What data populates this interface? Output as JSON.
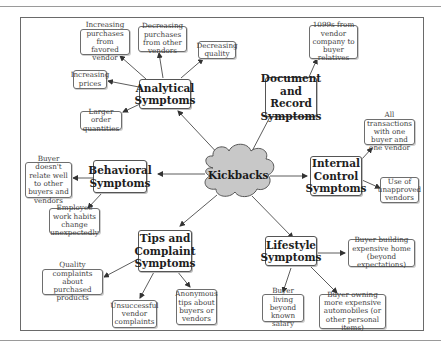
{
  "diagram": {
    "center": {
      "label": "Kickbacks",
      "shape": "cloud",
      "fill": "#c8c8c8"
    },
    "categories": [
      {
        "label": "Analytical Symptoms",
        "leaves": [
          "Increasing purchases from favored vendor",
          "Decreasing purchases from other vendors",
          "Decreasing quality",
          "Increasing prices",
          "Larger order quantities"
        ]
      },
      {
        "label": "Document and Record Symptoms",
        "leaves": [
          "1099s from vendor company to buyer relatives"
        ]
      },
      {
        "label": "Internal Control Symptoms",
        "leaves": [
          "All transactions with one buyer and one vendor",
          "Use of unapproved vendors"
        ]
      },
      {
        "label": "Behavioral Symptoms",
        "leaves": [
          "Buyer doesn't relate well to other buyers and vendors",
          "Employee work habits change unexpectedly"
        ]
      },
      {
        "label": "Tips and Complaint Symptoms",
        "leaves": [
          "Quality complaints about purchased products",
          "Unsuccessful vendor complaints",
          "Anonymous tips about buyers or vendors"
        ]
      },
      {
        "label": "Lifestyle Symptoms",
        "leaves": [
          "Buyer building expensive home (beyond expectations)",
          "Buyer living beyond known salary",
          "Buyer owning more expensive automobiles (or other personal items)"
        ]
      }
    ]
  }
}
